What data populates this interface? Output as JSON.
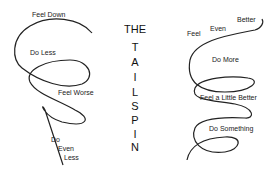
{
  "title": {
    "the": "THE",
    "letters": [
      "T",
      "A",
      "I",
      "L",
      "S",
      "P",
      "I",
      "N"
    ]
  },
  "left_spiral": {
    "labels": [
      "Feel Down",
      "Do Less",
      "Feel Worse",
      "Do",
      "Even",
      "Less"
    ]
  },
  "right_spiral": {
    "labels": [
      "Feel",
      "Even",
      "Better",
      "Do More",
      "Feel a Little Better",
      "Do Something"
    ]
  },
  "colors": {
    "line": "#222222",
    "background": "#ffffff"
  }
}
